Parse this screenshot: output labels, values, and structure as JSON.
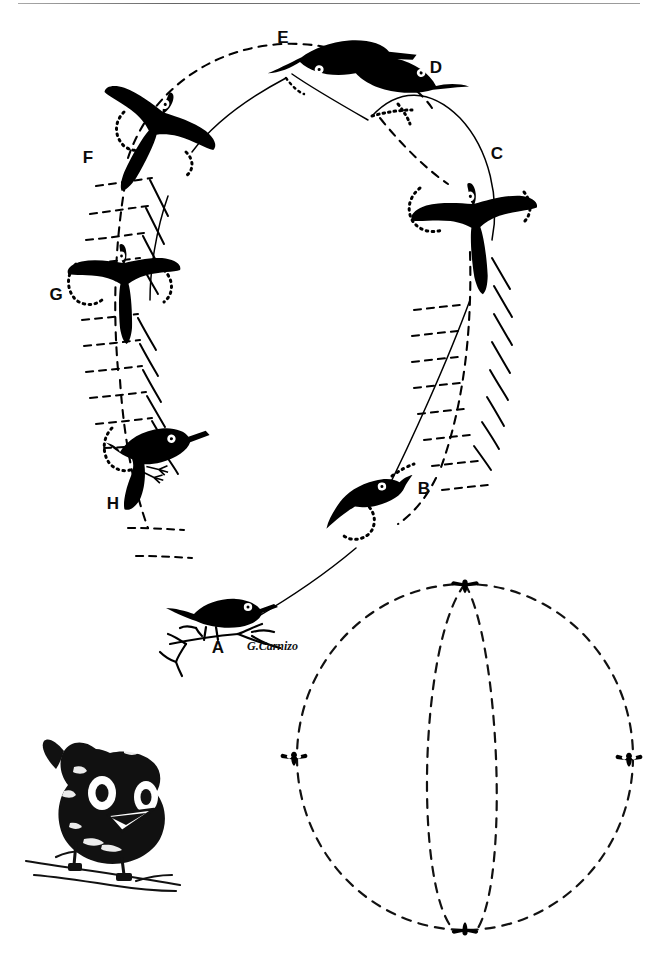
{
  "figure": {
    "medium": "pen-and-ink line drawing",
    "background_color": "#ffffff",
    "ink_color": "#000000",
    "signature": "G.Carnizo",
    "stage_labels": [
      "A",
      "B",
      "C",
      "D",
      "E",
      "F",
      "G",
      "H"
    ],
    "stages": [
      {
        "id": "A",
        "label": "A",
        "x": 218,
        "y": 646,
        "pose": "perched on twig, side view facing right"
      },
      {
        "id": "B",
        "label": "B",
        "x": 424,
        "y": 487,
        "pose": "ascending, side view facing upper right"
      },
      {
        "id": "C",
        "label": "C",
        "x": 497,
        "y": 152,
        "pose": "frontal, wings spread, head up, long tail down"
      },
      {
        "id": "D",
        "label": "D",
        "x": 436,
        "y": 66,
        "pose": "gliding level, side view facing left"
      },
      {
        "id": "E",
        "label": "E",
        "x": 283,
        "y": 36,
        "pose": "top of arc, side view facing left, tail fanned"
      },
      {
        "id": "F",
        "label": "F",
        "x": 88,
        "y": 156,
        "pose": "frontal, wings spread, descending, head down-right"
      },
      {
        "id": "G",
        "label": "G",
        "x": 56,
        "y": 293,
        "pose": "frontal, wings spread, head down"
      },
      {
        "id": "H",
        "label": "H",
        "x": 113,
        "y": 502,
        "pose": "braking, legs forward, facing right"
      }
    ],
    "portrait": {
      "name": "bird-portrait",
      "x": 30,
      "y": 730,
      "description": "stylized frontal bird portrait perched on twig with two large white eyes and triangular beak"
    },
    "sphere": {
      "name": "sphere-diagram",
      "cx": 465,
      "cy": 750,
      "rx": 168,
      "ry": 170,
      "description": "dashed sphere with meridian lines and birds at four cardinal points",
      "markers": [
        {
          "position": "top",
          "x": 465,
          "y": 582
        },
        {
          "position": "left",
          "x": 294,
          "y": 757
        },
        {
          "position": "right",
          "x": 629,
          "y": 758
        },
        {
          "position": "bottom",
          "x": 465,
          "y": 932
        }
      ]
    }
  }
}
